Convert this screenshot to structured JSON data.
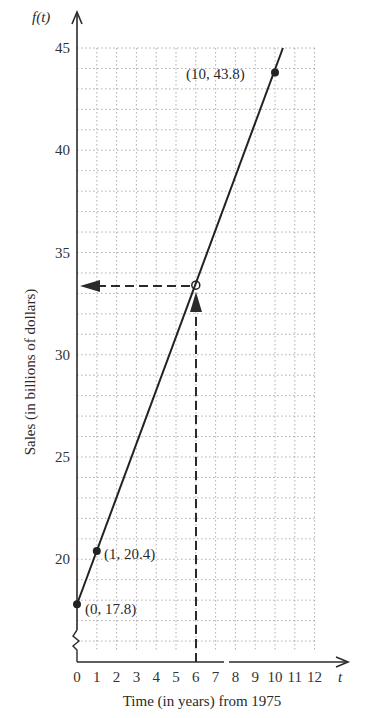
{
  "chart_data": {
    "type": "line",
    "title": "",
    "xlabel": "Time (in years) from 1975",
    "ylabel": "Sales (in billions of dollars)",
    "x_axis_symbol": "t",
    "y_axis_symbol": "f(t)",
    "xlim": [
      0,
      12
    ],
    "ylim": [
      15,
      45
    ],
    "x_ticks": [
      "0",
      "1",
      "2",
      "3",
      "4",
      "5",
      "6",
      "7",
      "8",
      "9",
      "10",
      "11",
      "12"
    ],
    "y_ticks": [
      "20",
      "25",
      "30",
      "35",
      "40",
      "45"
    ],
    "grid": true,
    "axis_break_on_y": true,
    "series": [
      {
        "name": "f(t)",
        "x": [
          0,
          1,
          10
        ],
        "y": [
          17.8,
          20.4,
          43.8
        ],
        "line_extends_to": [
          10.4,
          45
        ]
      }
    ],
    "annotations": [
      {
        "label": "(0, 17.8)",
        "x": 0,
        "y": 17.8
      },
      {
        "label": "(1, 20.4)",
        "x": 1,
        "y": 20.4
      },
      {
        "label": "(10, 43.8)",
        "x": 10,
        "y": 43.8
      }
    ],
    "guide": {
      "description": "Dashed lines from t = 6 up to the line, then left to the f(t) axis",
      "x": 6,
      "y": 33.4
    }
  },
  "labels": {
    "xlabel": "Time (in years) from 1975",
    "ylabel": "Sales (in billions of dollars)",
    "x_symbol": "t",
    "y_symbol": "f(t)",
    "ann0": "(0, 17.8)",
    "ann1": "(1, 20.4)",
    "ann2": "(10, 43.8)"
  }
}
